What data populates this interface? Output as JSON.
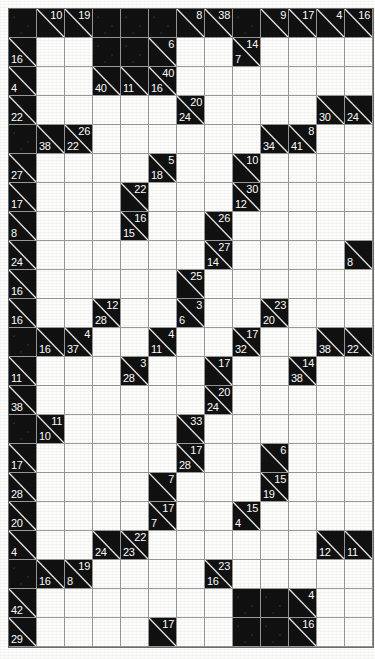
{
  "puzzle": {
    "name": "Kakuro",
    "columns": 13,
    "rows": 22,
    "colors": {
      "block": "#111111",
      "white": "#fdfdfb",
      "grid_line": "#9a9a9a",
      "clue_text": "#ffffff"
    },
    "legend": {
      "down_clue_position": "upper-right",
      "right_clue_position": "lower-left"
    },
    "cells": [
      [
        {
          "t": "b"
        },
        {
          "t": "c",
          "d": "10"
        },
        {
          "t": "c",
          "d": "19"
        },
        {
          "t": "b"
        },
        {
          "t": "b"
        },
        {
          "t": "b"
        },
        {
          "t": "c",
          "d": "8"
        },
        {
          "t": "c",
          "d": "38"
        },
        {
          "t": "b"
        },
        {
          "t": "c",
          "d": "9"
        },
        {
          "t": "c",
          "d": "17"
        },
        {
          "t": "c",
          "d": "4"
        },
        {
          "t": "c",
          "d": "16"
        }
      ],
      [
        {
          "t": "c",
          "r": "16"
        },
        {
          "t": "w"
        },
        {
          "t": "w"
        },
        {
          "t": "b"
        },
        {
          "t": "b"
        },
        {
          "t": "c",
          "d": "6"
        },
        {
          "t": "w"
        },
        {
          "t": "w"
        },
        {
          "t": "c",
          "d": "14",
          "r": "7"
        },
        {
          "t": "w"
        },
        {
          "t": "w"
        },
        {
          "t": "w"
        },
        {
          "t": "w"
        }
      ],
      [
        {
          "t": "c",
          "r": "4"
        },
        {
          "t": "w"
        },
        {
          "t": "w"
        },
        {
          "t": "c",
          "r": "40"
        },
        {
          "t": "c",
          "r": "11"
        },
        {
          "t": "c",
          "d": "40",
          "r": "16"
        },
        {
          "t": "w"
        },
        {
          "t": "w"
        },
        {
          "t": "w"
        },
        {
          "t": "w"
        },
        {
          "t": "w"
        },
        {
          "t": "w"
        },
        {
          "t": "w"
        }
      ],
      [
        {
          "t": "c",
          "r": "22"
        },
        {
          "t": "w"
        },
        {
          "t": "w"
        },
        {
          "t": "w"
        },
        {
          "t": "w"
        },
        {
          "t": "w"
        },
        {
          "t": "c",
          "d": "20",
          "r": "24"
        },
        {
          "t": "w"
        },
        {
          "t": "w"
        },
        {
          "t": "w"
        },
        {
          "t": "w"
        },
        {
          "t": "c",
          "r": "30"
        },
        {
          "t": "c",
          "r": "24"
        }
      ],
      [
        {
          "t": "b"
        },
        {
          "t": "c",
          "r": "38"
        },
        {
          "t": "c",
          "d": "26",
          "r": "22"
        },
        {
          "t": "w"
        },
        {
          "t": "w"
        },
        {
          "t": "w"
        },
        {
          "t": "w"
        },
        {
          "t": "w"
        },
        {
          "t": "w"
        },
        {
          "t": "c",
          "r": "34"
        },
        {
          "t": "c",
          "d": "8",
          "r": "41"
        },
        {
          "t": "w"
        },
        {
          "t": "w"
        }
      ],
      [
        {
          "t": "c",
          "r": "27"
        },
        {
          "t": "w"
        },
        {
          "t": "w"
        },
        {
          "t": "w"
        },
        {
          "t": "w"
        },
        {
          "t": "c",
          "d": "5",
          "r": "18"
        },
        {
          "t": "w"
        },
        {
          "t": "w"
        },
        {
          "t": "c",
          "d": "10"
        },
        {
          "t": "w"
        },
        {
          "t": "w"
        },
        {
          "t": "w"
        },
        {
          "t": "w"
        }
      ],
      [
        {
          "t": "c",
          "r": "17"
        },
        {
          "t": "w"
        },
        {
          "t": "w"
        },
        {
          "t": "w"
        },
        {
          "t": "c",
          "d": "22"
        },
        {
          "t": "w"
        },
        {
          "t": "w"
        },
        {
          "t": "w"
        },
        {
          "t": "c",
          "d": "30",
          "r": "12"
        },
        {
          "t": "w"
        },
        {
          "t": "w"
        },
        {
          "t": "w"
        },
        {
          "t": "w"
        }
      ],
      [
        {
          "t": "c",
          "r": "8"
        },
        {
          "t": "w"
        },
        {
          "t": "w"
        },
        {
          "t": "w"
        },
        {
          "t": "c",
          "d": "16",
          "r": "15"
        },
        {
          "t": "w"
        },
        {
          "t": "w"
        },
        {
          "t": "c",
          "d": "26"
        },
        {
          "t": "w"
        },
        {
          "t": "w"
        },
        {
          "t": "w"
        },
        {
          "t": "w"
        },
        {
          "t": "w"
        }
      ],
      [
        {
          "t": "c",
          "r": "24"
        },
        {
          "t": "w"
        },
        {
          "t": "w"
        },
        {
          "t": "w"
        },
        {
          "t": "w"
        },
        {
          "t": "w"
        },
        {
          "t": "w"
        },
        {
          "t": "c",
          "d": "27",
          "r": "14"
        },
        {
          "t": "w"
        },
        {
          "t": "w"
        },
        {
          "t": "w"
        },
        {
          "t": "w"
        },
        {
          "t": "c",
          "r": "8"
        }
      ],
      [
        {
          "t": "c",
          "r": "16"
        },
        {
          "t": "w"
        },
        {
          "t": "w"
        },
        {
          "t": "w"
        },
        {
          "t": "w"
        },
        {
          "t": "w"
        },
        {
          "t": "c",
          "d": "25"
        },
        {
          "t": "w"
        },
        {
          "t": "w"
        },
        {
          "t": "w"
        },
        {
          "t": "w"
        },
        {
          "t": "w"
        },
        {
          "t": "w"
        }
      ],
      [
        {
          "t": "c",
          "r": "16"
        },
        {
          "t": "w"
        },
        {
          "t": "w"
        },
        {
          "t": "c",
          "d": "12",
          "r": "28"
        },
        {
          "t": "w"
        },
        {
          "t": "w"
        },
        {
          "t": "c",
          "d": "3",
          "r": "6"
        },
        {
          "t": "w"
        },
        {
          "t": "w"
        },
        {
          "t": "c",
          "d": "23",
          "r": "20"
        },
        {
          "t": "w"
        },
        {
          "t": "w"
        },
        {
          "t": "w"
        }
      ],
      [
        {
          "t": "b"
        },
        {
          "t": "c",
          "r": "16"
        },
        {
          "t": "c",
          "d": "4",
          "r": "37"
        },
        {
          "t": "w"
        },
        {
          "t": "w"
        },
        {
          "t": "c",
          "d": "4",
          "r": "11"
        },
        {
          "t": "w"
        },
        {
          "t": "w"
        },
        {
          "t": "c",
          "d": "17",
          "r": "32"
        },
        {
          "t": "w"
        },
        {
          "t": "w"
        },
        {
          "t": "c",
          "r": "38"
        },
        {
          "t": "c",
          "r": "22"
        }
      ],
      [
        {
          "t": "c",
          "r": "11"
        },
        {
          "t": "w"
        },
        {
          "t": "w"
        },
        {
          "t": "w"
        },
        {
          "t": "c",
          "d": "3",
          "r": "28"
        },
        {
          "t": "w"
        },
        {
          "t": "w"
        },
        {
          "t": "c",
          "d": "17"
        },
        {
          "t": "w"
        },
        {
          "t": "w"
        },
        {
          "t": "c",
          "d": "14",
          "r": "38"
        },
        {
          "t": "w"
        },
        {
          "t": "w"
        }
      ],
      [
        {
          "t": "c",
          "r": "38"
        },
        {
          "t": "w"
        },
        {
          "t": "w"
        },
        {
          "t": "w"
        },
        {
          "t": "w"
        },
        {
          "t": "w"
        },
        {
          "t": "w"
        },
        {
          "t": "c",
          "d": "20",
          "r": "24"
        },
        {
          "t": "w"
        },
        {
          "t": "w"
        },
        {
          "t": "w"
        },
        {
          "t": "w"
        },
        {
          "t": "w"
        }
      ],
      [
        {
          "t": "b"
        },
        {
          "t": "c",
          "d": "11",
          "r": "10"
        },
        {
          "t": "w"
        },
        {
          "t": "w"
        },
        {
          "t": "w"
        },
        {
          "t": "w"
        },
        {
          "t": "c",
          "d": "33"
        },
        {
          "t": "w"
        },
        {
          "t": "w"
        },
        {
          "t": "w"
        },
        {
          "t": "w"
        },
        {
          "t": "w"
        },
        {
          "t": "w"
        }
      ],
      [
        {
          "t": "c",
          "r": "17"
        },
        {
          "t": "w"
        },
        {
          "t": "w"
        },
        {
          "t": "w"
        },
        {
          "t": "w"
        },
        {
          "t": "w"
        },
        {
          "t": "c",
          "d": "17",
          "r": "28"
        },
        {
          "t": "w"
        },
        {
          "t": "w"
        },
        {
          "t": "c",
          "d": "6"
        },
        {
          "t": "w"
        },
        {
          "t": "w"
        },
        {
          "t": "w"
        }
      ],
      [
        {
          "t": "c",
          "r": "28"
        },
        {
          "t": "w"
        },
        {
          "t": "w"
        },
        {
          "t": "w"
        },
        {
          "t": "w"
        },
        {
          "t": "c",
          "d": "7"
        },
        {
          "t": "w"
        },
        {
          "t": "w"
        },
        {
          "t": "w"
        },
        {
          "t": "c",
          "d": "15",
          "r": "19"
        },
        {
          "t": "w"
        },
        {
          "t": "w"
        },
        {
          "t": "w"
        }
      ],
      [
        {
          "t": "c",
          "r": "20"
        },
        {
          "t": "w"
        },
        {
          "t": "w"
        },
        {
          "t": "w"
        },
        {
          "t": "w"
        },
        {
          "t": "c",
          "d": "17",
          "r": "7"
        },
        {
          "t": "w"
        },
        {
          "t": "w"
        },
        {
          "t": "c",
          "d": "15",
          "r": "4"
        },
        {
          "t": "w"
        },
        {
          "t": "w"
        },
        {
          "t": "w"
        },
        {
          "t": "w"
        }
      ],
      [
        {
          "t": "c",
          "r": "4"
        },
        {
          "t": "w"
        },
        {
          "t": "w"
        },
        {
          "t": "c",
          "r": "24"
        },
        {
          "t": "c",
          "d": "22",
          "r": "23"
        },
        {
          "t": "w"
        },
        {
          "t": "w"
        },
        {
          "t": "w"
        },
        {
          "t": "w"
        },
        {
          "t": "w"
        },
        {
          "t": "w"
        },
        {
          "t": "c",
          "r": "12"
        },
        {
          "t": "c",
          "r": "11"
        }
      ],
      [
        {
          "t": "b"
        },
        {
          "t": "c",
          "r": "16"
        },
        {
          "t": "c",
          "d": "19",
          "r": "8"
        },
        {
          "t": "w"
        },
        {
          "t": "w"
        },
        {
          "t": "w"
        },
        {
          "t": "w"
        },
        {
          "t": "c",
          "d": "23",
          "r": "16"
        },
        {
          "t": "w"
        },
        {
          "t": "w"
        },
        {
          "t": "w"
        },
        {
          "t": "w"
        },
        {
          "t": "w"
        }
      ],
      [
        {
          "t": "c",
          "r": "42"
        },
        {
          "t": "w"
        },
        {
          "t": "w"
        },
        {
          "t": "w"
        },
        {
          "t": "w"
        },
        {
          "t": "w"
        },
        {
          "t": "w"
        },
        {
          "t": "w"
        },
        {
          "t": "b"
        },
        {
          "t": "b"
        },
        {
          "t": "c",
          "d": "4"
        },
        {
          "t": "w"
        },
        {
          "t": "w"
        }
      ],
      [
        {
          "t": "c",
          "r": "29"
        },
        {
          "t": "w"
        },
        {
          "t": "w"
        },
        {
          "t": "w"
        },
        {
          "t": "w"
        },
        {
          "t": "c",
          "d": "17"
        },
        {
          "t": "w"
        },
        {
          "t": "w"
        },
        {
          "t": "b"
        },
        {
          "t": "b"
        },
        {
          "t": "c",
          "d": "16"
        },
        {
          "t": "w"
        },
        {
          "t": "w"
        }
      ]
    ]
  }
}
